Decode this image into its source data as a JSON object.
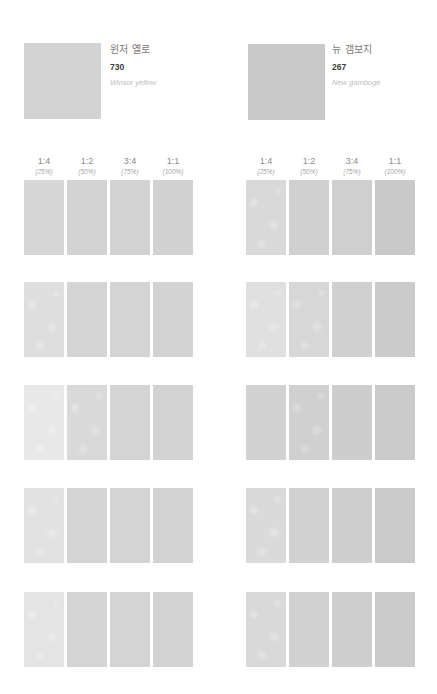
{
  "paints": [
    {
      "korean_name": "윈저 옐로",
      "number": "730",
      "english_name": "Winsor yellow",
      "swatch_color": "#d3d3d3"
    },
    {
      "korean_name": "뉴 갬보지",
      "number": "267",
      "english_name": "New gamboge",
      "swatch_color": "#c9c9c9"
    }
  ],
  "dilution_headers": [
    {
      "ratio": "1:4",
      "percent": "(25%)"
    },
    {
      "ratio": "1:2",
      "percent": "(50%)"
    },
    {
      "ratio": "3:4",
      "percent": "(75%)"
    },
    {
      "ratio": "1:1",
      "percent": "(100%)"
    }
  ],
  "swatch_rows": {
    "left": [
      [
        "#d6d6d6",
        "#d3d3d3",
        "#d3d3d3",
        "#d2d2d2"
      ],
      [
        "#dedede",
        "#d5d5d5",
        "#d4d4d4",
        "#d3d3d3"
      ],
      [
        "#e8e8e8",
        "#d9d9d9",
        "#d4d4d4",
        "#d3d3d3"
      ],
      [
        "#e2e2e2",
        "#d5d5d5",
        "#d4d4d4",
        "#d3d3d3"
      ],
      [
        "#e4e4e4",
        "#d5d5d5",
        "#d4d4d4",
        "#d3d3d3"
      ]
    ],
    "right": [
      [
        "#d9d9d9",
        "#d0d0d0",
        "#cfcfcf",
        "#c9c9c9"
      ],
      [
        "#e0e0e0",
        "#d7d7d7",
        "#d0d0d0",
        "#cbcbcb"
      ],
      [
        "#d2d2d2",
        "#d0d0d0",
        "#cdcdcd",
        "#cacaca"
      ],
      [
        "#dadada",
        "#d1d1d1",
        "#cecece",
        "#cacaca"
      ],
      [
        "#d9d9d9",
        "#d1d1d1",
        "#cecece",
        "#cbcbcb"
      ]
    ]
  },
  "textured": {
    "left": [
      [
        false,
        false,
        false,
        false
      ],
      [
        true,
        false,
        false,
        false
      ],
      [
        true,
        true,
        false,
        false
      ],
      [
        true,
        false,
        false,
        false
      ],
      [
        true,
        false,
        false,
        false
      ]
    ],
    "right": [
      [
        true,
        false,
        false,
        false
      ],
      [
        true,
        true,
        false,
        false
      ],
      [
        false,
        true,
        false,
        false
      ],
      [
        true,
        false,
        false,
        false
      ],
      [
        true,
        false,
        false,
        false
      ]
    ]
  }
}
